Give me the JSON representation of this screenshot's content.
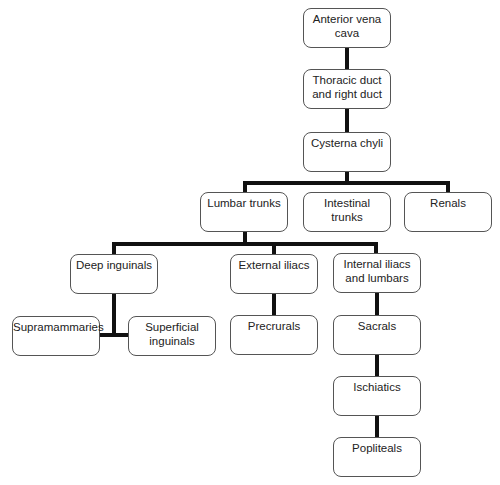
{
  "diagram": {
    "type": "flowchart-tree",
    "title": "",
    "nodes": [
      {
        "id": "anterior_vena_cava",
        "label": "Anterior vena cava",
        "x": 303,
        "y": 8,
        "w": 88,
        "h": 40
      },
      {
        "id": "thoracic_duct",
        "label": "Thoracic duct and right duct",
        "x": 303,
        "y": 69,
        "w": 88,
        "h": 40
      },
      {
        "id": "cysterna_chyli",
        "label": "Cysterna chyli",
        "x": 303,
        "y": 132,
        "w": 88,
        "h": 40
      },
      {
        "id": "lumbar_trunks",
        "label": "Lumbar trunks",
        "x": 200,
        "y": 192,
        "w": 88,
        "h": 40
      },
      {
        "id": "intestinal_trunks",
        "label": "Intestinal trunks",
        "x": 303,
        "y": 192,
        "w": 88,
        "h": 40
      },
      {
        "id": "renals",
        "label": "Renals",
        "x": 404,
        "y": 192,
        "w": 88,
        "h": 40
      },
      {
        "id": "deep_inguinals",
        "label": "Deep inguinals",
        "x": 70,
        "y": 254,
        "w": 88,
        "h": 40
      },
      {
        "id": "external_iliacs",
        "label": "External iliacs",
        "x": 230,
        "y": 254,
        "w": 88,
        "h": 40
      },
      {
        "id": "internal_iliacs",
        "label": "Internal iliacs and lumbars",
        "x": 333,
        "y": 253,
        "w": 88,
        "h": 40
      },
      {
        "id": "supramammaries",
        "label": "Supramammaries",
        "x": 12,
        "y": 316,
        "w": 88,
        "h": 40
      },
      {
        "id": "superficial_inguinals",
        "label": "Superficial inguinals",
        "x": 128,
        "y": 316,
        "w": 88,
        "h": 40
      },
      {
        "id": "precrurals",
        "label": "Precrurals",
        "x": 230,
        "y": 315,
        "w": 88,
        "h": 40
      },
      {
        "id": "sacrals",
        "label": "Sacrals",
        "x": 333,
        "y": 315,
        "w": 88,
        "h": 40
      },
      {
        "id": "ischiatics",
        "label": "Ischiatics",
        "x": 333,
        "y": 376,
        "w": 88,
        "h": 40
      },
      {
        "id": "popliteals",
        "label": "Popliteals",
        "x": 333,
        "y": 437,
        "w": 88,
        "h": 40
      }
    ],
    "edges": [
      {
        "from": "thoracic_duct",
        "to": "anterior_vena_cava"
      },
      {
        "from": "cysterna_chyli",
        "to": "thoracic_duct"
      },
      {
        "from": "lumbar_trunks",
        "to": "cysterna_chyli"
      },
      {
        "from": "intestinal_trunks",
        "to": "cysterna_chyli"
      },
      {
        "from": "renals",
        "to": "cysterna_chyli"
      },
      {
        "from": "deep_inguinals",
        "to": "lumbar_trunks"
      },
      {
        "from": "external_iliacs",
        "to": "lumbar_trunks"
      },
      {
        "from": "internal_iliacs",
        "to": "lumbar_trunks"
      },
      {
        "from": "supramammaries",
        "to": "deep_inguinals"
      },
      {
        "from": "superficial_inguinals",
        "to": "deep_inguinals"
      },
      {
        "from": "precrurals",
        "to": "external_iliacs"
      },
      {
        "from": "sacrals",
        "to": "internal_iliacs"
      },
      {
        "from": "ischiatics",
        "to": "sacrals"
      },
      {
        "from": "popliteals",
        "to": "ischiatics"
      }
    ],
    "colors": {
      "line": "#111111",
      "border": "#555555",
      "fill": "#ffffff",
      "text": "#222222"
    }
  }
}
